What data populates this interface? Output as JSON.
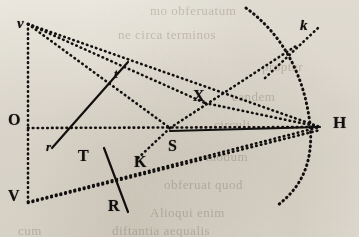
{
  "figure": {
    "kind": "geometry-diagram",
    "caption_style": "engraved plate, dotted construction lines",
    "ink_color": "#141210",
    "paper_color": "#f2f0ea",
    "labels": [
      {
        "id": "v",
        "text": "v",
        "style": "italic-lower",
        "x": 17,
        "y": 16,
        "size": 15,
        "point": [
          28,
          24
        ]
      },
      {
        "id": "O",
        "text": "O",
        "style": "roman-upper",
        "x": 8,
        "y": 112,
        "size": 16,
        "point": [
          28,
          128
        ]
      },
      {
        "id": "V",
        "text": "V",
        "style": "roman-upper",
        "x": 8,
        "y": 188,
        "size": 16,
        "point": [
          28,
          202
        ]
      },
      {
        "id": "r",
        "text": "r",
        "style": "italic-lower",
        "x": 46,
        "y": 140,
        "size": 13,
        "point": [
          54,
          146
        ]
      },
      {
        "id": "t",
        "text": "t",
        "style": "italic-lower",
        "x": 114,
        "y": 67,
        "size": 13,
        "point": [
          112,
          74
        ]
      },
      {
        "id": "T",
        "text": "T",
        "style": "roman-upper",
        "x": 78,
        "y": 148,
        "size": 16,
        "point": [
          88,
          158
        ]
      },
      {
        "id": "R",
        "text": "R",
        "style": "roman-upper",
        "x": 108,
        "y": 198,
        "size": 16,
        "point": [
          118,
          208
        ]
      },
      {
        "id": "K",
        "text": "K",
        "style": "roman-upper",
        "x": 134,
        "y": 154,
        "size": 16,
        "point": [
          142,
          164
        ]
      },
      {
        "id": "S",
        "text": "S",
        "style": "roman-upper",
        "x": 168,
        "y": 138,
        "size": 16,
        "point": [
          170,
          128
        ]
      },
      {
        "id": "X",
        "text": "X",
        "style": "roman-upper",
        "x": 193,
        "y": 88,
        "size": 16,
        "point": [
          200,
          100
        ]
      },
      {
        "id": "k",
        "text": "k",
        "style": "italic-lower",
        "x": 300,
        "y": 18,
        "size": 15,
        "point": [
          304,
          36
        ]
      },
      {
        "id": "H",
        "text": "H",
        "style": "roman-upper",
        "x": 333,
        "y": 114,
        "size": 17,
        "point": [
          320,
          127
        ]
      }
    ],
    "points": {
      "v": [
        28,
        24
      ],
      "O": [
        28,
        128
      ],
      "V": [
        28,
        202
      ],
      "S": [
        170,
        128
      ],
      "X": [
        205,
        103
      ],
      "H": [
        320,
        127
      ],
      "k": [
        307,
        42
      ]
    },
    "segments": [
      {
        "name": "v-O-V-vertical-axis",
        "stroke": "dotted",
        "from": [
          28,
          24
        ],
        "to": [
          28,
          202
        ]
      },
      {
        "name": "v-to-H-upper-chord",
        "stroke": "dotted",
        "from": [
          28,
          24
        ],
        "to": [
          320,
          127
        ]
      },
      {
        "name": "v-to-X-to-H-ray",
        "stroke": "dotted",
        "from": [
          28,
          24
        ],
        "to": [
          205,
          103
        ]
      },
      {
        "name": "X-to-H-ray",
        "stroke": "dotted",
        "from": [
          205,
          103
        ],
        "to": [
          320,
          127
        ]
      },
      {
        "name": "O-to-H-horizontal",
        "stroke": "dotted",
        "from": [
          28,
          128
        ],
        "to": [
          320,
          127
        ]
      },
      {
        "name": "v-to-S-diagonal",
        "stroke": "dotted",
        "from": [
          28,
          24
        ],
        "to": [
          170,
          128
        ]
      },
      {
        "name": "S-to-H-solid-chord",
        "stroke": "solid",
        "from": [
          170,
          131
        ],
        "to": [
          320,
          127
        ]
      },
      {
        "name": "V-to-H-upper-ray",
        "stroke": "dotted",
        "from": [
          28,
          202
        ],
        "to": [
          320,
          127
        ]
      },
      {
        "name": "V-to-K-to-H-lower-ray",
        "stroke": "dotted",
        "from": [
          28,
          203
        ],
        "to": [
          320,
          130
        ]
      },
      {
        "name": "S-to-K-short-tick",
        "stroke": "dotted",
        "from": [
          170,
          128
        ],
        "to": [
          136,
          160
        ]
      },
      {
        "name": "t-transversal-solid",
        "stroke": "solid",
        "from": [
          128,
          62
        ],
        "to": [
          52,
          148
        ]
      },
      {
        "name": "R-transversal-solid",
        "stroke": "solid",
        "from": [
          104,
          148
        ],
        "to": [
          128,
          212
        ]
      },
      {
        "name": "k-ray-through-arc",
        "stroke": "dotted",
        "from": [
          265,
          78
        ],
        "to": [
          318,
          28
        ]
      },
      {
        "name": "S-to-k-upper-ray",
        "stroke": "dotted",
        "from": [
          170,
          128
        ],
        "to": [
          296,
          46
        ]
      }
    ],
    "arcs": [
      {
        "name": "great-arc-through-H-and-k",
        "stroke": "dotted",
        "path": "M 246,8 C 282,34 304,74 310,124 C 314,164 300,188 278,205",
        "center_hint": "centre near O, passes through k and H"
      }
    ]
  },
  "bleed_through_text": {
    "note": "faint text showing through from the reverse of the printed page",
    "lines": [
      {
        "text": "mo obferuatum",
        "x": 150,
        "y": 4,
        "size": 13
      },
      {
        "text": "ne circa terminos",
        "x": 118,
        "y": 28,
        "size": 13
      },
      {
        "text": "propter",
        "x": 262,
        "y": 60,
        "size": 13
      },
      {
        "text": "eandem",
        "x": 232,
        "y": 90,
        "size": 13
      },
      {
        "text": "circuli",
        "x": 214,
        "y": 118,
        "size": 13
      },
      {
        "text": "modum",
        "x": 206,
        "y": 150,
        "size": 13
      },
      {
        "text": "obferuat quod",
        "x": 164,
        "y": 178,
        "size": 13
      },
      {
        "text": "Alioqui enim",
        "x": 150,
        "y": 206,
        "size": 13
      },
      {
        "text": "diftantia aequalis",
        "x": 112,
        "y": 224,
        "size": 13
      },
      {
        "text": "cum",
        "x": 18,
        "y": 224,
        "size": 13
      }
    ]
  }
}
